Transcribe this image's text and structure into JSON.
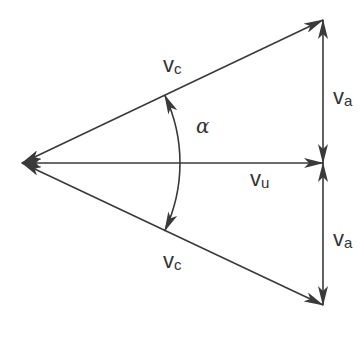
{
  "diagram": {
    "type": "velocity-vector-diagram",
    "colors": {
      "line": "#3a3a3a",
      "text": "#333333",
      "background": "#ffffff"
    },
    "labels": {
      "vc_top": {
        "symbol": "v",
        "subscript": "c"
      },
      "vc_bottom": {
        "symbol": "v",
        "subscript": "c"
      },
      "vu": {
        "symbol": "v",
        "subscript": "u"
      },
      "va_top": {
        "symbol": "v",
        "subscript": "a"
      },
      "va_bottom": {
        "symbol": "v",
        "subscript": "a"
      },
      "angle": "α"
    },
    "vectors": [
      {
        "name": "vc-top",
        "from": [
          22,
          163
        ],
        "to": [
          323,
          20
        ],
        "arrowheads": [
          "start",
          "end"
        ]
      },
      {
        "name": "vu",
        "from": [
          22,
          163
        ],
        "to": [
          323,
          163
        ],
        "arrowheads": [
          "start",
          "end"
        ]
      },
      {
        "name": "vc-bottom",
        "from": [
          22,
          163
        ],
        "to": [
          323,
          305
        ],
        "arrowheads": [
          "start",
          "end"
        ]
      },
      {
        "name": "va-top",
        "from": [
          323,
          20
        ],
        "to": [
          323,
          163
        ],
        "arrowheads": [
          "start",
          "end"
        ]
      },
      {
        "name": "va-bottom",
        "from": [
          323,
          163
        ],
        "to": [
          323,
          305
        ],
        "arrowheads": [
          "start",
          "end"
        ]
      }
    ],
    "angle_arc": {
      "center": [
        22,
        163
      ],
      "radius": 158,
      "between": [
        "vc-top",
        "vc-bottom"
      ],
      "arrowheads": [
        "start",
        "end"
      ]
    }
  }
}
